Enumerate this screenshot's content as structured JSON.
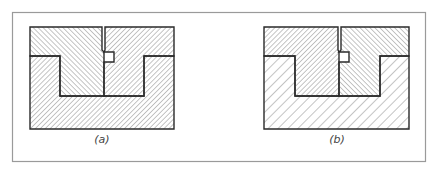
{
  "figure": {
    "panels": [
      {
        "id": "a",
        "caption": "(a)",
        "description": "Two interlocking upper parts seated in a lower base; all three regions use dense hatching"
      },
      {
        "id": "b",
        "caption": "(b)",
        "description": "Same assembly; lower base uses wider, lighter hatching"
      }
    ],
    "colors": {
      "outline": "#2a2a2a",
      "hatch": "#8a8a8a",
      "frame": "#9a9a9a",
      "background": "#ffffff"
    }
  }
}
